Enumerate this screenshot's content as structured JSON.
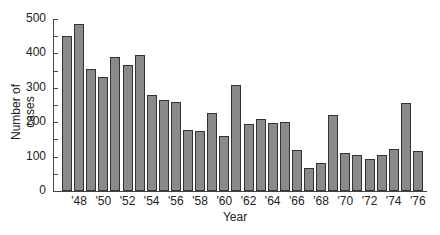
{
  "chart_data": {
    "type": "bar",
    "title": "",
    "xlabel": "Year",
    "ylabel": "Number of cases",
    "ylim": [
      0,
      500
    ],
    "yticks": [
      0,
      100,
      200,
      300,
      400,
      500
    ],
    "ytick_labels": [
      "0",
      "100",
      "200",
      "300",
      "400",
      "500"
    ],
    "xtick_labels": [
      "'48",
      "'50",
      "'52",
      "'54",
      "'56",
      "'58",
      "'60",
      "'62",
      "'64",
      "'66",
      "'68",
      "'70",
      "'72",
      "'74",
      "'76"
    ],
    "categories": [
      "1947",
      "1948",
      "1949",
      "1950",
      "1951",
      "1952",
      "1953",
      "1954",
      "1955",
      "1956",
      "1957",
      "1958",
      "1959",
      "1960",
      "1961",
      "1962",
      "1963",
      "1964",
      "1965",
      "1966",
      "1967",
      "1968",
      "1969",
      "1970",
      "1971",
      "1972",
      "1973",
      "1974",
      "1975",
      "1976"
    ],
    "values": [
      450,
      485,
      355,
      330,
      390,
      365,
      395,
      278,
      265,
      260,
      178,
      175,
      228,
      160,
      308,
      195,
      210,
      198,
      200,
      118,
      68,
      80,
      222,
      110,
      105,
      92,
      105,
      122,
      255,
      115
    ],
    "grid": false,
    "legend": null,
    "bar_color": "#8a8a8a",
    "bar_edge_color": "#333333"
  },
  "labels": {
    "xlabel": "Year",
    "ylabel": "Number of cases"
  }
}
